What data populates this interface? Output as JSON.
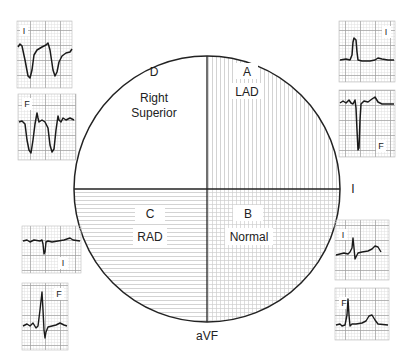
{
  "diagram": {
    "axis_labels": {
      "horizontal": "I",
      "vertical": "aVF"
    },
    "quadrants": [
      {
        "id": "A",
        "letter": "A",
        "name": "LAD",
        "position": "upper-right",
        "pattern": "vertical-lines"
      },
      {
        "id": "B",
        "letter": "B",
        "name": "Normal",
        "position": "lower-right",
        "pattern": "grid"
      },
      {
        "id": "C",
        "letter": "C",
        "name": "RAD",
        "position": "lower-left",
        "pattern": "horizontal-lines"
      },
      {
        "id": "D",
        "letter": "D",
        "name_line1": "Right",
        "name_line2": "Superior",
        "position": "upper-left",
        "pattern": "none"
      }
    ],
    "ecg_panels": [
      {
        "id": "D-I",
        "lead": "I",
        "quadrant": "D",
        "qrs": "negative"
      },
      {
        "id": "D-F",
        "lead": "F",
        "quadrant": "D",
        "qrs": "negative"
      },
      {
        "id": "A-I",
        "lead": "I",
        "quadrant": "A",
        "qrs": "positive"
      },
      {
        "id": "A-F",
        "lead": "F",
        "quadrant": "A",
        "qrs": "negative"
      },
      {
        "id": "C-I",
        "lead": "I",
        "quadrant": "C",
        "qrs": "negative"
      },
      {
        "id": "C-F",
        "lead": "F",
        "quadrant": "C",
        "qrs": "positive"
      },
      {
        "id": "B-I",
        "lead": "I",
        "quadrant": "B",
        "qrs": "positive"
      },
      {
        "id": "B-F",
        "lead": "F",
        "quadrant": "B",
        "qrs": "positive"
      }
    ],
    "colors": {
      "outline": "#222222",
      "hatch": "#c8c8c8",
      "ecg_grid": "#bdbdbd",
      "ecg_trace": "#1a1a1a"
    }
  }
}
